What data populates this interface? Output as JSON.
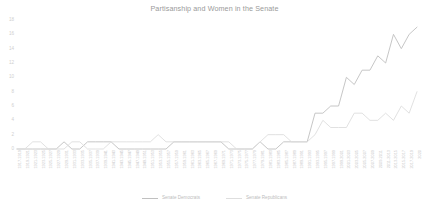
{
  "chart_data": {
    "type": "line",
    "title": "Partisanship and Women in the Senate",
    "xlabel": "",
    "ylabel": "",
    "ylim": [
      0,
      18
    ],
    "yticks": [
      0,
      2,
      4,
      6,
      8,
      10,
      12,
      14,
      16,
      18
    ],
    "grid": false,
    "legend_position": "bottom",
    "categories": [
      "1917-1919",
      "1919-1921",
      "1921-1923",
      "1923-1925",
      "1925-1927",
      "1927-1929",
      "1929-1931",
      "1931-1933",
      "1933-1935",
      "1935-1937",
      "1937-1939",
      "1939-1941",
      "1941-1943",
      "1943-1945",
      "1945-1947",
      "1947-1949",
      "1949-1951",
      "1951-1953",
      "1953-1955",
      "1955-1957",
      "1957-1959",
      "1959-1961",
      "1961-1963",
      "1963-1965",
      "1965-1967",
      "1967-1969",
      "1969-1971",
      "1971-1973",
      "1973-1975",
      "1975-1977",
      "1977-1979",
      "1979-1981",
      "1981-1983",
      "1983-1985",
      "1985-1987",
      "1987-1989",
      "1989-1991",
      "1991-1993",
      "1993-1995",
      "1995-1997",
      "1997-1999",
      "1999-2001",
      "2001-2003",
      "2003-2005",
      "2005-2007",
      "2007-2009",
      "2009-2011",
      "2011-2013",
      "2013-2015",
      "2015-2017",
      "2017-2019",
      "2020"
    ],
    "series": [
      {
        "name": "Senate Democrats",
        "color": "#c0c0c0",
        "values": [
          0,
          0,
          0,
          0,
          0,
          0,
          1,
          0,
          0,
          1,
          1,
          1,
          1,
          0,
          0,
          0,
          0,
          0,
          0,
          0,
          1,
          1,
          1,
          1,
          1,
          1,
          1,
          0,
          0,
          0,
          0,
          1,
          0,
          0,
          1,
          1,
          1,
          1,
          5,
          5,
          6,
          6,
          10,
          9,
          11,
          11,
          13,
          12,
          16,
          14,
          16,
          17
        ]
      },
      {
        "name": "Senate Republicans",
        "color": "#dedede",
        "values": [
          0,
          0,
          1,
          1,
          0,
          0,
          0,
          1,
          1,
          0,
          0,
          0,
          1,
          1,
          1,
          1,
          1,
          1,
          2,
          1,
          1,
          1,
          1,
          1,
          1,
          1,
          1,
          1,
          0,
          0,
          0,
          1,
          2,
          2,
          2,
          1,
          1,
          1,
          2,
          4,
          3,
          3,
          3,
          5,
          5,
          4,
          4,
          5,
          4,
          6,
          5,
          8
        ]
      }
    ]
  }
}
